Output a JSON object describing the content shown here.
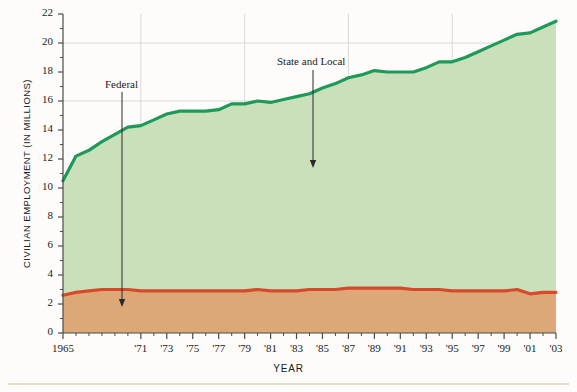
{
  "chart_data": {
    "type": "area",
    "title": "",
    "subtitle": "",
    "xlabel": "YEAR",
    "ylabel": "CIVILIAN EMPLOYMENT (IN MILLIONS)",
    "stacked": true,
    "grid": true,
    "legend_position": "inline-annotations",
    "xlim": [
      1965,
      2003
    ],
    "ylim": [
      0,
      22
    ],
    "ytick_step": 2,
    "ytick_labels": [
      "0",
      "2",
      "4",
      "6",
      "8",
      "10",
      "12",
      "14",
      "16",
      "18",
      "20",
      "22"
    ],
    "ytick_values": [
      0,
      2,
      4,
      6,
      8,
      10,
      12,
      14,
      16,
      18,
      20,
      22
    ],
    "xtick_labels": [
      "1965",
      "'71",
      "'73",
      "'75",
      "'77",
      "'79",
      "'81",
      "'83",
      "'85",
      "'87",
      "'89",
      "'91",
      "'93",
      "'95",
      "'97",
      "'99",
      "'01",
      "'03"
    ],
    "xtick_values": [
      1965,
      1971,
      1973,
      1975,
      1977,
      1979,
      1981,
      1983,
      1985,
      1987,
      1989,
      1991,
      1993,
      1995,
      1997,
      1999,
      2001,
      2003
    ],
    "minor_xticks": "every year 1965-2003",
    "gridline_x_values": [
      1971,
      1979,
      1987,
      1995
    ],
    "gridline_y_values": [
      16,
      20
    ],
    "x": [
      1965,
      1966,
      1967,
      1968,
      1969,
      1970,
      1971,
      1972,
      1973,
      1974,
      1975,
      1976,
      1977,
      1978,
      1979,
      1980,
      1981,
      1982,
      1983,
      1984,
      1985,
      1986,
      1987,
      1988,
      1989,
      1990,
      1991,
      1992,
      1993,
      1994,
      1995,
      1996,
      1997,
      1998,
      1999,
      2000,
      2001,
      2002,
      2003
    ],
    "series": [
      {
        "name": "Federal",
        "color": "#d8492a",
        "fill_color": "#dda878",
        "values": [
          2.6,
          2.8,
          2.9,
          3.0,
          3.0,
          3.0,
          2.9,
          2.9,
          2.9,
          2.9,
          2.9,
          2.9,
          2.9,
          2.9,
          2.9,
          3.0,
          2.9,
          2.9,
          2.9,
          3.0,
          3.0,
          3.0,
          3.1,
          3.1,
          3.1,
          3.1,
          3.1,
          3.0,
          3.0,
          3.0,
          2.9,
          2.9,
          2.9,
          2.9,
          2.9,
          3.0,
          2.7,
          2.8,
          2.8
        ]
      },
      {
        "name": "State and Local",
        "color": "#1e9959",
        "fill_color": "#c9e0bb",
        "values": [
          7.9,
          9.4,
          9.7,
          10.2,
          10.7,
          11.2,
          11.4,
          11.8,
          12.2,
          12.4,
          12.4,
          12.4,
          12.5,
          12.9,
          12.9,
          13.0,
          13.0,
          13.2,
          13.4,
          13.5,
          13.9,
          14.2,
          14.5,
          14.7,
          15.0,
          14.9,
          14.9,
          15.0,
          15.3,
          15.7,
          15.8,
          16.1,
          16.5,
          16.9,
          17.3,
          17.6,
          18.0,
          18.3,
          18.7
        ]
      }
    ],
    "totals": [
      10.5,
      12.2,
      12.6,
      13.2,
      13.7,
      14.2,
      14.3,
      14.7,
      15.1,
      15.3,
      15.3,
      15.3,
      15.4,
      15.8,
      15.8,
      16.0,
      15.9,
      16.1,
      16.3,
      16.5,
      16.9,
      17.2,
      17.6,
      17.8,
      18.1,
      18.0,
      18.0,
      18.0,
      18.3,
      18.7,
      18.7,
      19.0,
      19.4,
      19.8,
      20.2,
      20.6,
      20.7,
      21.1,
      21.5
    ],
    "annotations": [
      {
        "label": "Federal",
        "target_series": "Federal",
        "x_position": 1973,
        "text_x": 105,
        "text_y": 78,
        "arrow_x": 122,
        "arrow_top": 92,
        "arrow_bottom": 307
      },
      {
        "label": "State and Local",
        "target_series": "State and Local",
        "x_position": 1987,
        "text_x": 277,
        "text_y": 55,
        "arrow_x": 313,
        "arrow_top": 70,
        "arrow_bottom": 168
      }
    ],
    "colors": {
      "background": "#fdfcfa",
      "axis": "#4a4a4a",
      "gridline": "#d8d8d8",
      "text": "#1b1b1b",
      "bottom_rule": "#eadcc8"
    }
  }
}
